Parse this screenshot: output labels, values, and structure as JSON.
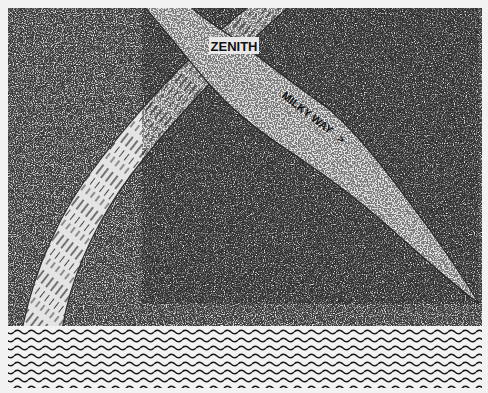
{
  "illustration": {
    "labels": {
      "zenith": "ZENITH",
      "milky_way": "MILKY WAY",
      "milky_way_arrow": ">"
    },
    "colors": {
      "paper": "#f2f2f2",
      "sky_dark": "#3a3a3a",
      "sky_light": "#9a9a9a",
      "band_fill": "#e4e4e4",
      "ink": "#111111"
    },
    "regions": {
      "sky": {
        "x": 8,
        "y": 8,
        "width": 474,
        "height": 318
      },
      "water": {
        "x": 8,
        "y": 326,
        "width": 474,
        "height": 62,
        "wave_rows": 8
      }
    }
  }
}
